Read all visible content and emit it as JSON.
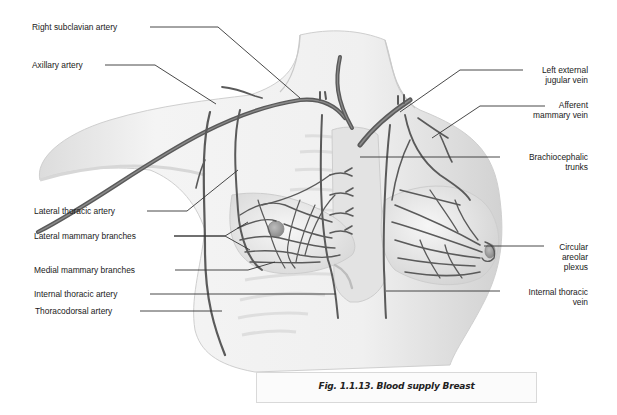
{
  "figure": {
    "caption": "Fig. 1.1.13. Blood supply Breast"
  },
  "labels": {
    "left": [
      {
        "id": "right-subclavian-artery",
        "text": "Right subclavian artery"
      },
      {
        "id": "axillary-artery",
        "text": "Axillary artery"
      },
      {
        "id": "lateral-thoracic-artery",
        "text": "Lateral thoracic artery"
      },
      {
        "id": "lateral-mammary-branches",
        "text": "Lateral mammary branches"
      },
      {
        "id": "medial-mammary-branches",
        "text": "Medial mammary branches"
      },
      {
        "id": "internal-thoracic-artery",
        "text": "Internal thoracic artery"
      },
      {
        "id": "thoracodorsal-artery",
        "text": "Thoracodorsal artery"
      }
    ],
    "right": [
      {
        "id": "left-external-jugular-vein",
        "line1": "Left external",
        "line2": "jugular vein"
      },
      {
        "id": "afferent-mammary-vein",
        "line1": "Afferent",
        "line2": "mammary vein"
      },
      {
        "id": "brachiocephalic-trunks",
        "line1": "Brachiocephalic",
        "line2": "trunks"
      },
      {
        "id": "circular-areolar-plexus",
        "line1": "Circular",
        "line2": "areolar",
        "line3": "plexus"
      },
      {
        "id": "internal-thoracic-vein",
        "line1": "Internal thoracic",
        "line2": "vein"
      }
    ]
  },
  "colors": {
    "vessel": "#5a5a5a",
    "skin": "#ececec",
    "skin_shadow": "#cfcfcf",
    "leader_line": "#333333",
    "caption_border": "#d9d9d9"
  }
}
